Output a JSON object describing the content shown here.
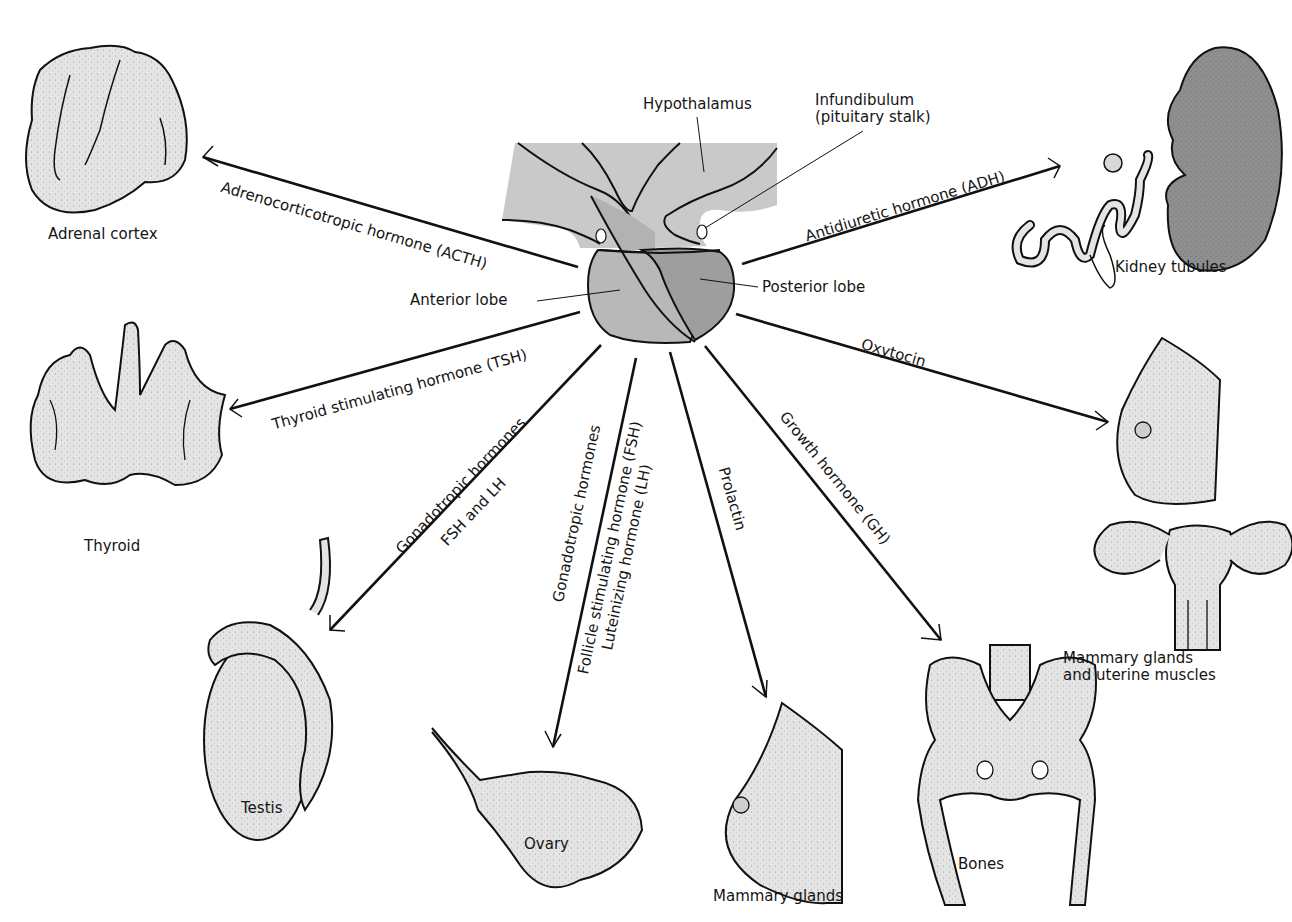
{
  "figure": {
    "colors": {
      "background": "#ffffff",
      "line": "#111111",
      "organ_fill_light": "#e6e6e6",
      "hypothalamus_fill": "#c9c9c9",
      "anterior_lobe_fill": "#b8b8b8",
      "posterior_lobe_fill": "#9e9e9e",
      "kidney_fill": "#8f8f8f"
    }
  },
  "structures": {
    "hypothalamus": "Hypothalamus",
    "infundibulum_line1": "Infundibulum",
    "infundibulum_line2": "(pituitary stalk)",
    "anterior_lobe": "Anterior lobe",
    "posterior_lobe": "Posterior lobe"
  },
  "hormones": {
    "acth": "Adrenocorticotropic hormone (ACTH)",
    "tsh": "Thyroid stimulating hormone (TSH)",
    "gonado_male_line1": "Gonadotropic hormones",
    "gonado_male_line2": "FSH and LH",
    "gonado_female_line1": "Gonadotropic hormones",
    "gonado_female_line2": "Follicle stimulating hormone (FSH)",
    "gonado_female_line3": "Luteinizing hormone (LH)",
    "prolactin": "Prolactin",
    "gh": "Growth hormone (GH)",
    "oxytocin": "Oxytocin",
    "adh": "Antidiuretic hormone (ADH)"
  },
  "targets": {
    "adrenal": "Adrenal cortex",
    "thyroid": "Thyroid",
    "testis": "Testis",
    "ovary": "Ovary",
    "mammary": "Mammary glands",
    "bones": "Bones",
    "mammary_uterine_line1": "Mammary glands",
    "mammary_uterine_line2": "and uterine muscles",
    "kidney": "Kidney tubules"
  }
}
